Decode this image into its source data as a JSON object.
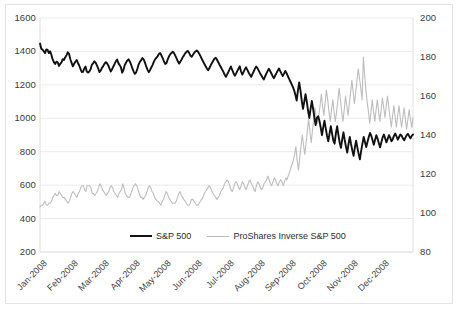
{
  "chart_data": {
    "type": "line",
    "title": "",
    "xlabel": "",
    "ylabel": "",
    "grid": true,
    "legend_position": "bottom",
    "x_tick_labels": [
      "Jan-2008",
      "Feb-2008",
      "Mar-2008",
      "Apr-2008",
      "May-2008",
      "Jun-2008",
      "Jul-2008",
      "Aug-2008",
      "Sep-2008",
      "Oct-2008",
      "Nov-2008",
      "Dec-2008"
    ],
    "axes": {
      "left": {
        "label": "",
        "ylim": [
          200,
          1600
        ],
        "ticks": [
          200,
          400,
          600,
          800,
          1000,
          1200,
          1400,
          1600
        ],
        "tick_labels": [
          "200",
          "400",
          "600",
          "800",
          "1000",
          "1200",
          "1400",
          "1600"
        ]
      },
      "right": {
        "label": "",
        "ylim": [
          80,
          200
        ],
        "ticks": [
          80,
          100,
          120,
          140,
          160,
          180,
          200
        ],
        "tick_labels": [
          "80",
          "100",
          "120",
          "140",
          "160",
          "180",
          "200"
        ]
      }
    },
    "colors": {
      "series_primary": "#111111",
      "series_secondary": "#bdbdbd",
      "grid": "#ebebeb",
      "frame": "#e3e3e3",
      "text": "#3a3a3a",
      "background": "#ffffff"
    },
    "series": [
      {
        "name": "S&P 500",
        "axis": "left",
        "color": "#111111",
        "line_width": 1.9,
        "values": [
          1447,
          1416,
          1411,
          1401,
          1390,
          1412,
          1409,
          1390,
          1401,
          1380,
          1352,
          1336,
          1325,
          1339,
          1335,
          1313,
          1326,
          1335,
          1354,
          1349,
          1365,
          1378,
          1395,
          1385,
          1353,
          1331,
          1311,
          1326,
          1338,
          1349,
          1331,
          1316,
          1296,
          1277,
          1278,
          1297,
          1310,
          1280,
          1273,
          1280,
          1293,
          1320,
          1328,
          1341,
          1333,
          1317,
          1299,
          1277,
          1285,
          1302,
          1312,
          1326,
          1336,
          1329,
          1316,
          1297,
          1280,
          1293,
          1310,
          1325,
          1341,
          1352,
          1330,
          1318,
          1305,
          1273,
          1289,
          1318,
          1332,
          1345,
          1353,
          1340,
          1322,
          1300,
          1281,
          1266,
          1274,
          1296,
          1322,
          1338,
          1348,
          1360,
          1352,
          1333,
          1310,
          1291,
          1276,
          1288,
          1304,
          1318,
          1337,
          1353,
          1362,
          1371,
          1385,
          1390,
          1377,
          1360,
          1342,
          1325,
          1330,
          1352,
          1370,
          1384,
          1391,
          1398,
          1390,
          1375,
          1358,
          1341,
          1327,
          1339,
          1352,
          1367,
          1378,
          1390,
          1399,
          1403,
          1390,
          1375,
          1368,
          1380,
          1392,
          1400,
          1406,
          1398,
          1385,
          1370,
          1355,
          1340,
          1325,
          1311,
          1298,
          1287,
          1301,
          1317,
          1331,
          1344,
          1356,
          1362,
          1350,
          1335,
          1320,
          1307,
          1292,
          1278,
          1262,
          1248,
          1262,
          1278,
          1294,
          1310,
          1289,
          1271,
          1255,
          1267,
          1282,
          1297,
          1311,
          1280,
          1261,
          1278,
          1293,
          1305,
          1290,
          1274,
          1261,
          1248,
          1264,
          1280,
          1297,
          1310,
          1300,
          1285,
          1270,
          1257,
          1244,
          1232,
          1250,
          1267,
          1282,
          1296,
          1283,
          1268,
          1252,
          1240,
          1256,
          1270,
          1285,
          1298,
          1282,
          1267,
          1253,
          1267,
          1283,
          1270,
          1253,
          1236,
          1220,
          1204,
          1187,
          1167,
          1140,
          1106,
          1166,
          1214,
          1167,
          1106,
          1056,
          1099,
          1144,
          1099,
          1046,
          1002,
          1056,
          1104,
          1057,
          1005,
          960,
          1003,
          1012,
          985,
          945,
          899,
          946,
          985,
          940,
          896,
          862,
          908,
          953,
          908,
          866,
          848,
          909,
          952,
          901,
          855,
          823,
          873,
          916,
          870,
          830,
          795,
          846,
          889,
          846,
          808,
          775,
          825,
          866,
          824,
          787,
          755,
          805,
          848,
          889,
          858,
          828,
          858,
          888,
          912,
          896,
          869,
          842,
          871,
          899,
          877,
          851,
          826,
          856,
          886,
          903,
          880,
          856,
          877,
          899,
          884,
          862,
          875,
          896,
          909,
          891,
          872,
          888,
          903,
          896,
          880,
          868,
          884,
          899,
          907,
          893,
          880,
          895,
          903
        ]
      },
      {
        "name": "ProShares Inverse S&P 500",
        "axis": "right",
        "color": "#bdbdbd",
        "line_width": 1.1,
        "values": [
          103,
          104,
          104,
          105,
          106,
          104,
          104,
          105,
          105,
          106,
          108,
          109,
          110,
          109,
          109,
          111,
          110,
          109,
          108,
          108,
          107,
          106,
          105,
          106,
          108,
          110,
          111,
          110,
          109,
          108,
          110,
          111,
          113,
          114,
          114,
          112,
          111,
          114,
          114,
          114,
          113,
          110,
          110,
          109,
          110,
          111,
          113,
          115,
          114,
          112,
          111,
          110,
          109,
          110,
          111,
          113,
          114,
          113,
          111,
          110,
          109,
          108,
          110,
          111,
          112,
          115,
          113,
          110,
          109,
          108,
          108,
          109,
          111,
          113,
          114,
          115,
          114,
          112,
          110,
          108,
          108,
          107,
          108,
          109,
          111,
          113,
          114,
          113,
          111,
          110,
          108,
          107,
          106,
          106,
          105,
          104,
          106,
          107,
          109,
          111,
          110,
          108,
          107,
          106,
          105,
          105,
          105,
          106,
          108,
          110,
          111,
          109,
          108,
          107,
          106,
          105,
          104,
          104,
          105,
          107,
          107,
          106,
          105,
          104,
          104,
          105,
          106,
          107,
          108,
          110,
          111,
          112,
          113,
          114,
          113,
          111,
          110,
          109,
          108,
          107,
          108,
          109,
          111,
          112,
          113,
          115,
          116,
          117,
          116,
          114,
          112,
          111,
          113,
          115,
          116,
          115,
          113,
          112,
          114,
          116,
          115,
          113,
          112,
          114,
          116,
          117,
          115,
          114,
          112,
          111,
          114,
          116,
          115,
          113,
          112,
          113,
          115,
          116,
          117,
          119,
          117,
          115,
          114,
          116,
          118,
          117,
          115,
          114,
          116,
          117,
          116,
          114,
          116,
          118,
          117,
          119,
          121,
          123,
          125,
          127,
          130,
          134,
          127,
          122,
          128,
          134,
          140,
          135,
          130,
          136,
          142,
          148,
          142,
          136,
          142,
          148,
          154,
          149,
          146,
          150,
          155,
          161,
          155,
          150,
          157,
          163,
          158,
          152,
          147,
          153,
          158,
          152,
          147,
          152,
          158,
          164,
          158,
          152,
          147,
          153,
          160,
          155,
          150,
          156,
          162,
          168,
          162,
          156,
          162,
          168,
          174,
          169,
          164,
          158,
          180,
          171,
          163,
          157,
          152,
          146,
          152,
          158,
          152,
          147,
          153,
          158,
          152,
          147,
          153,
          159,
          154,
          149,
          155,
          160,
          154,
          149,
          144,
          150,
          155,
          149,
          144,
          150,
          155,
          149,
          144,
          149,
          154,
          148,
          143,
          148,
          153,
          148,
          144,
          149
        ]
      }
    ]
  },
  "legend": {
    "entries": [
      {
        "label": "S&P 500",
        "swatch": "series-primary"
      },
      {
        "label": "ProShares Inverse S&P 500",
        "swatch": "series-secondary"
      }
    ]
  }
}
